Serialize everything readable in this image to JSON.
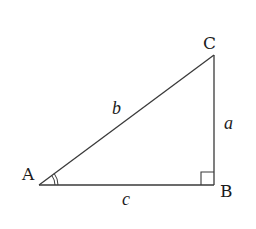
{
  "diagram": {
    "type": "right-triangle",
    "vertices": [
      {
        "id": "A",
        "label": "A",
        "x": 39,
        "y": 185
      },
      {
        "id": "B",
        "label": "B",
        "x": 214,
        "y": 185
      },
      {
        "id": "C",
        "label": "C",
        "x": 214,
        "y": 55
      }
    ],
    "sides": [
      {
        "id": "a",
        "label": "a",
        "from": "B",
        "to": "C"
      },
      {
        "id": "b",
        "label": "b",
        "from": "A",
        "to": "C"
      },
      {
        "id": "c",
        "label": "c",
        "from": "A",
        "to": "B"
      }
    ],
    "right_angle_at": "B",
    "marked_angle": "A",
    "colors": {
      "stroke": "#3a3a3a",
      "text": "#1c1c1c",
      "background": "#ffffff"
    }
  }
}
